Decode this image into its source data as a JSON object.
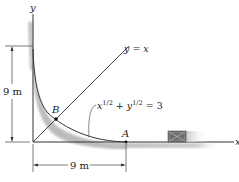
{
  "diagram": {
    "axes": {
      "x_label": "x",
      "y_label": "y"
    },
    "line": {
      "label": "y = x"
    },
    "curve": {
      "equation_x": "x",
      "equation_sup1": "1/2",
      "equation_plus": " + ",
      "equation_y": "y",
      "equation_sup2": "1/2",
      "equation_rhs": " = 3"
    },
    "points": {
      "A": "A",
      "B": "B"
    },
    "dimensions": {
      "vertical": "9 m",
      "horizontal": "9 m"
    },
    "colors": {
      "line": "#333333",
      "shading": "#b8b8b8",
      "crate": "#6e6e6e"
    }
  }
}
